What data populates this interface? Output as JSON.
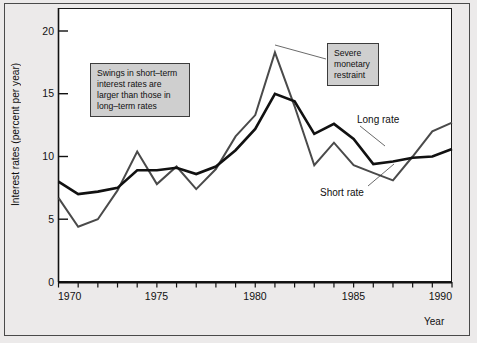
{
  "figure": {
    "background_color": "#eceaea",
    "plot_background_color": "#ffffff",
    "frame_color": "#4a4a4a"
  },
  "axes": {
    "ylabel": "Interest rates (percent per year)",
    "xlabel": "Year",
    "y_ticks": [
      "0",
      "5",
      "10",
      "15",
      "20"
    ],
    "x_ticks": [
      "1970",
      "1975",
      "1980",
      "1985",
      "1990"
    ]
  },
  "annotations": [
    {
      "name": "swings-callout",
      "text": "Swings in short–term\ninterest rates are\nlarger than those in\nlong–term rates",
      "box_color": "#cfcfcf"
    },
    {
      "name": "restraint-callout",
      "text": "Severe\nmonetary\nrestraint",
      "box_color": "#cfcfcf"
    }
  ],
  "series_labels": {
    "long_rate": "Long rate",
    "short_rate": "Short rate"
  },
  "chart_data": {
    "type": "line",
    "title": "",
    "xlabel": "Year",
    "ylabel": "Interest rates (percent per year)",
    "xlim": [
      1970,
      1990
    ],
    "ylim": [
      0,
      21.5
    ],
    "grid": false,
    "legend": "inline-labels",
    "x": [
      1970,
      1971,
      1972,
      1973,
      1974,
      1975,
      1976,
      1977,
      1978,
      1979,
      1980,
      1981,
      1982,
      1983,
      1984,
      1985,
      1986,
      1987,
      1988,
      1989,
      1990
    ],
    "series": [
      {
        "name": "Long rate",
        "color": "#111111",
        "line_width": 2.6,
        "values": [
          8.0,
          7.0,
          7.2,
          7.5,
          8.9,
          8.9,
          9.1,
          8.6,
          9.2,
          10.5,
          12.2,
          15.0,
          14.4,
          11.8,
          12.6,
          11.4,
          9.4,
          9.6,
          9.9,
          10.0,
          10.6
        ]
      },
      {
        "name": "Short rate",
        "color": "#4a4a4a",
        "line_width": 2.0,
        "values": [
          6.7,
          4.4,
          5.0,
          7.3,
          10.4,
          7.8,
          9.2,
          7.4,
          9.0,
          11.6,
          13.3,
          18.3,
          14.0,
          9.3,
          11.1,
          9.3,
          8.7,
          8.1,
          10.0,
          12.0,
          12.7
        ]
      }
    ],
    "annotations": [
      {
        "text": "Swings in short–term interest rates are larger than those in long–term rates",
        "x": 1972.3,
        "y": 17.0
      },
      {
        "text": "Severe monetary restraint",
        "x": 1984.0,
        "y": 19.3,
        "points_to": {
          "x": 1981,
          "y": 18.3
        }
      }
    ]
  }
}
